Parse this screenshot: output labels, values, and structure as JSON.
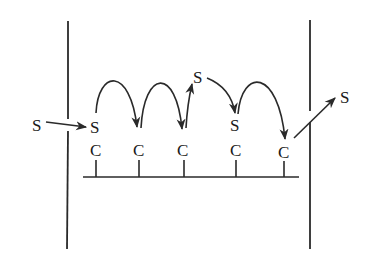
{
  "diagram": {
    "labels": {
      "s_incoming": "S",
      "s_site1": "S",
      "c_site1": "C",
      "c_site2": "C",
      "c_site3": "C",
      "s_top": "S",
      "s_site4": "S",
      "c_site4": "C",
      "c_site5": "C",
      "s_outgoing": "S"
    },
    "colors": {
      "ink": "#2a2a2a",
      "background": "#ffffff"
    }
  }
}
